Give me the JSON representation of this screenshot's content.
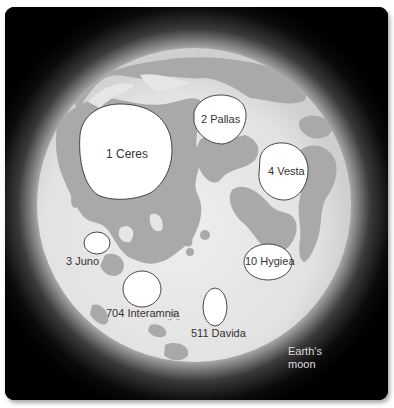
{
  "figure": {
    "background": "#000000",
    "moon_label": [
      "Earth's",
      "moon"
    ],
    "colors": {
      "moon_highlands": "#d9d9d9",
      "moon_maria": "#a8a8a8",
      "asteroid_fill": "#ffffff",
      "asteroid_outline": "#333333",
      "label_text": "#333333"
    },
    "asteroids": [
      {
        "name": "1 Ceres",
        "cx": 124,
        "cy": 152,
        "rx": 47,
        "ry": 46
      },
      {
        "name": "2 Pallas",
        "cx": 220,
        "cy": 120,
        "rx": 27,
        "ry": 25
      },
      {
        "name": "4 Vesta",
        "cx": 284,
        "cy": 172,
        "rx": 25,
        "ry": 28
      },
      {
        "name": "3 Juno",
        "cx": 97,
        "cy": 243,
        "rx": 13,
        "ry": 11
      },
      {
        "name": "704 Interamnia",
        "cx": 142,
        "cy": 289,
        "rx": 19,
        "ry": 18
      },
      {
        "name": "10 Hygiea",
        "cx": 268,
        "cy": 262,
        "rx": 24,
        "ry": 18
      },
      {
        "name": "511 Davida",
        "cx": 215,
        "cy": 307,
        "rx": 12,
        "ry": 19
      }
    ]
  }
}
